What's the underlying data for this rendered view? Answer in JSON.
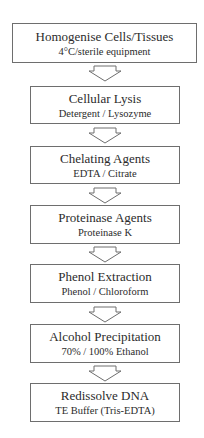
{
  "diagram": {
    "type": "flowchart",
    "direction": "top-to-bottom",
    "colors": {
      "border": "#6e6e6e",
      "text": "#2b2b2b",
      "background": "#ffffff"
    },
    "steps": [
      {
        "title": "Homogenise Cells/Tissues",
        "subtitle": "4°C/sterile equipment"
      },
      {
        "title": "Cellular Lysis",
        "subtitle": "Detergent / Lysozyme"
      },
      {
        "title": "Chelating Agents",
        "subtitle": "EDTA / Citrate"
      },
      {
        "title": "Proteinase Agents",
        "subtitle": "Proteinase K"
      },
      {
        "title": "Phenol Extraction",
        "subtitle": "Phenol / Chloroform"
      },
      {
        "title": "Alcohol Precipitation",
        "subtitle": "70% / 100% Ethanol"
      },
      {
        "title": "Redissolve DNA",
        "subtitle": "TE Buffer (Tris-EDTA)"
      }
    ],
    "arrows": [
      {
        "from": 0,
        "to": 1,
        "icon": "down-block-arrow-icon"
      },
      {
        "from": 1,
        "to": 2,
        "icon": "down-block-arrow-icon"
      },
      {
        "from": 2,
        "to": 3,
        "icon": "down-block-arrow-icon"
      },
      {
        "from": 3,
        "to": 4,
        "icon": "down-block-arrow-icon"
      },
      {
        "from": 4,
        "to": 5,
        "icon": "down-block-arrow-icon"
      },
      {
        "from": 5,
        "to": 6,
        "icon": "down-block-arrow-icon"
      }
    ]
  }
}
